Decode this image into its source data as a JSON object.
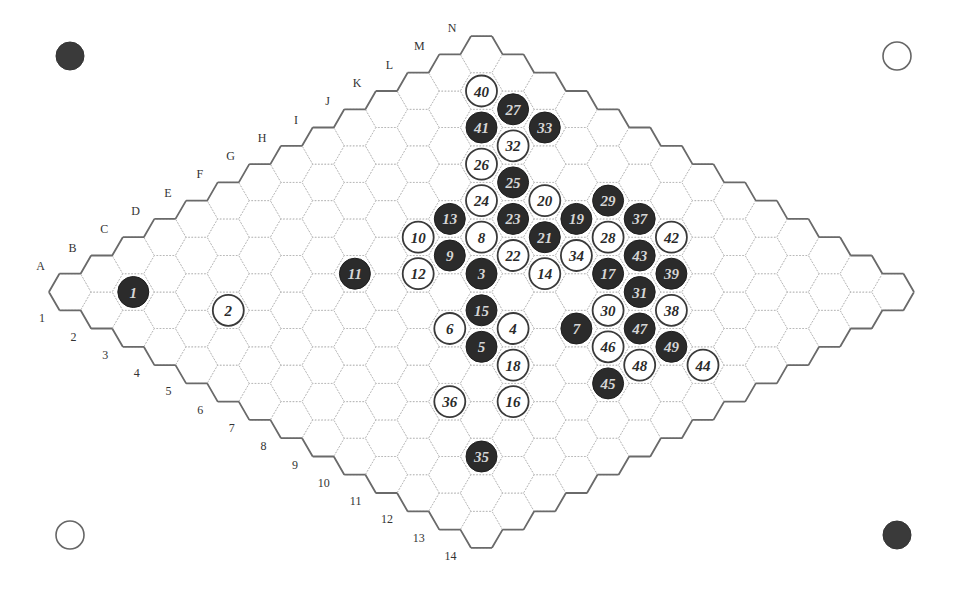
{
  "game": "Hex",
  "board": {
    "size": 14,
    "column_letters": [
      "A",
      "B",
      "C",
      "D",
      "E",
      "F",
      "G",
      "H",
      "I",
      "J",
      "K",
      "L",
      "M",
      "N"
    ],
    "row_numbers": [
      "1",
      "2",
      "3",
      "4",
      "5",
      "6",
      "7",
      "8",
      "9",
      "10",
      "11",
      "12",
      "13",
      "14"
    ]
  },
  "corner_markers": [
    {
      "position": "top-left",
      "color": "black"
    },
    {
      "position": "top-right",
      "color": "white"
    },
    {
      "position": "bottom-left",
      "color": "white"
    },
    {
      "position": "bottom-right",
      "color": "black"
    }
  ],
  "colors": {
    "black_stone": "#2b2b2b",
    "white_stone": "#ffffff",
    "grid_line": "#b8b8b8",
    "border": "#6a6a6a"
  },
  "moves": [
    {
      "n": 1,
      "cell": "B2",
      "color": "black"
    },
    {
      "n": 2,
      "cell": "C4",
      "color": "white"
    },
    {
      "n": 3,
      "cell": "H7",
      "color": "black"
    },
    {
      "n": 4,
      "cell": "G9",
      "color": "white"
    },
    {
      "n": 5,
      "cell": "F9",
      "color": "black"
    },
    {
      "n": 6,
      "cell": "F8",
      "color": "white"
    },
    {
      "n": 7,
      "cell": "H10",
      "color": "black"
    },
    {
      "n": 8,
      "cell": "I6",
      "color": "white"
    },
    {
      "n": 9,
      "cell": "H6",
      "color": "black"
    },
    {
      "n": 10,
      "cell": "H5",
      "color": "white"
    },
    {
      "n": 11,
      "cell": "F5",
      "color": "black"
    },
    {
      "n": 12,
      "cell": "G6",
      "color": "white"
    },
    {
      "n": 13,
      "cell": "I5",
      "color": "black"
    },
    {
      "n": 14,
      "cell": "I8",
      "color": "white"
    },
    {
      "n": 15,
      "cell": "G8",
      "color": "black"
    },
    {
      "n": 16,
      "cell": "E11",
      "color": "white"
    },
    {
      "n": 17,
      "cell": "J9",
      "color": "black"
    },
    {
      "n": 18,
      "cell": "F10",
      "color": "white"
    },
    {
      "n": 19,
      "cell": "K7",
      "color": "black"
    },
    {
      "n": 20,
      "cell": "K6",
      "color": "white"
    },
    {
      "n": 21,
      "cell": "J7",
      "color": "black"
    },
    {
      "n": 22,
      "cell": "I7",
      "color": "white"
    },
    {
      "n": 23,
      "cell": "J6",
      "color": "black"
    },
    {
      "n": 24,
      "cell": "J5",
      "color": "white"
    },
    {
      "n": 25,
      "cell": "K5",
      "color": "black"
    },
    {
      "n": 26,
      "cell": "K4",
      "color": "white"
    },
    {
      "n": 27,
      "cell": "M3",
      "color": "black"
    },
    {
      "n": 28,
      "cell": "K8",
      "color": "white"
    },
    {
      "n": 29,
      "cell": "L7",
      "color": "black"
    },
    {
      "n": 30,
      "cell": "I10",
      "color": "white"
    },
    {
      "n": 31,
      "cell": "J10",
      "color": "black"
    },
    {
      "n": 32,
      "cell": "L4",
      "color": "white"
    },
    {
      "n": 33,
      "cell": "M4",
      "color": "black"
    },
    {
      "n": 34,
      "cell": "J8",
      "color": "white"
    },
    {
      "n": 35,
      "cell": "C12",
      "color": "black"
    },
    {
      "n": 36,
      "cell": "D10",
      "color": "white"
    },
    {
      "n": 37,
      "cell": "L8",
      "color": "black"
    },
    {
      "n": 38,
      "cell": "J11",
      "color": "white"
    },
    {
      "n": 39,
      "cell": "K10",
      "color": "black"
    },
    {
      "n": 40,
      "cell": "M2",
      "color": "white"
    },
    {
      "n": 41,
      "cell": "L3",
      "color": "black"
    },
    {
      "n": 42,
      "cell": "L9",
      "color": "white"
    },
    {
      "n": 43,
      "cell": "K9",
      "color": "black"
    },
    {
      "n": 44,
      "cell": "I13",
      "color": "white"
    },
    {
      "n": 45,
      "cell": "G12",
      "color": "black"
    },
    {
      "n": 46,
      "cell": "H11",
      "color": "white"
    },
    {
      "n": 47,
      "cell": "I11",
      "color": "black"
    },
    {
      "n": 48,
      "cell": "H12",
      "color": "white"
    },
    {
      "n": 49,
      "cell": "I12",
      "color": "black"
    }
  ]
}
